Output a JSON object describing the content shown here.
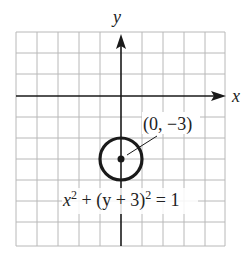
{
  "figure": {
    "axes": {
      "x_label": "x",
      "y_label": "y",
      "x_range": [
        -5,
        5
      ],
      "y_range": [
        -7,
        3
      ],
      "grid_step": 1
    },
    "circle": {
      "center": [
        0,
        -3
      ],
      "radius": 1,
      "center_label": "(0, −3)",
      "equation": {
        "part1": "x",
        "exp1": "2",
        "part2": " + (y + 3)",
        "exp2": "2",
        "part3": " = 1"
      }
    },
    "colors": {
      "grid": "#b8b8b8",
      "axis": "#1a1a1a",
      "circle": "#1a1a1a"
    }
  }
}
